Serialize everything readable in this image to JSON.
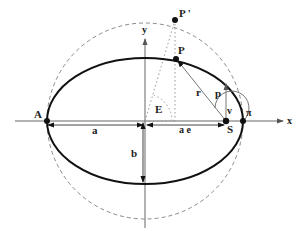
{
  "diagram": {
    "labels": {
      "point_apoapsis": "A",
      "point_periapsis": "π",
      "point_body": "P",
      "point_projected": "P '",
      "focus": "S",
      "axis_x": "x",
      "axis_y": "y",
      "semi_major": "a",
      "semi_minor": "b",
      "focal_offset": "a e",
      "eccentric_anomaly": "E",
      "radius_vector": "r",
      "semi_latus_rectum": "p",
      "true_anomaly": "v"
    },
    "colors": {
      "ellipse": "#111111",
      "circle": "#8a8a8a",
      "axes": "#666666",
      "construction": "#9a9a9a"
    }
  }
}
